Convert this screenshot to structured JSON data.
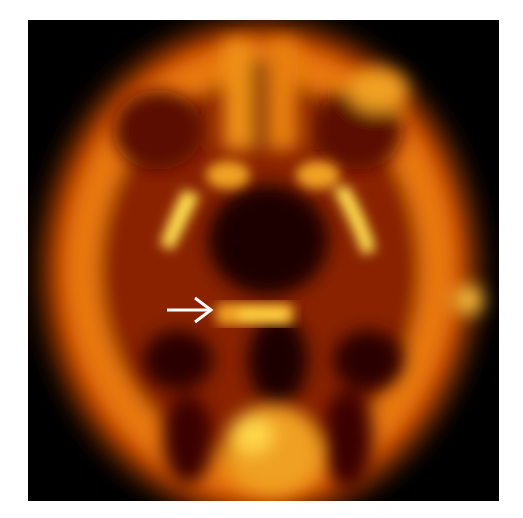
{
  "image": {
    "kind": "PET brain scan, axial slice",
    "colormap": [
      "#000000",
      "#3a0500",
      "#7a1a00",
      "#c44a00",
      "#f08a10",
      "#ffc830",
      "#fff070"
    ],
    "background": "#000000"
  },
  "annotations": {
    "arrow": {
      "glyph": "→",
      "color": "#ffffff",
      "direction": "right"
    }
  }
}
